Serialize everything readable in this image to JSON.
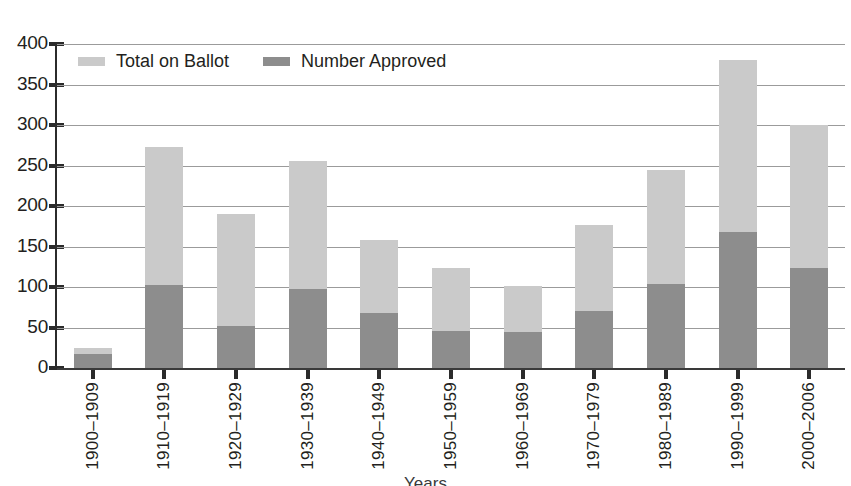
{
  "page": {
    "top_cropped_text": "",
    "x_axis_title_cropped": "Years"
  },
  "legend": {
    "position": "top-left-inside-plot",
    "items": [
      {
        "label": "Total on Ballot",
        "color": "#cacaca",
        "icon": "legend-swatch-icon"
      },
      {
        "label": "Number Approved",
        "color": "#8d8d8d",
        "icon": "legend-swatch-icon"
      }
    ]
  },
  "chart_data": {
    "type": "bar",
    "title": "",
    "subtitle": "",
    "xlabel": "Years",
    "ylabel": "",
    "grid": true,
    "legend_position": "upper-left",
    "ylim": [
      0,
      400
    ],
    "yticks": [
      0,
      50,
      100,
      150,
      200,
      250,
      300,
      350,
      400
    ],
    "ytick_labels": [
      "0",
      "50",
      "100",
      "150",
      "200",
      "250",
      "300",
      "350",
      "400"
    ],
    "bar_style": "overlaid",
    "categories": [
      "1900–1909",
      "1910–1919",
      "1920–1929",
      "1930–1939",
      "1940–1949",
      "1950–1959",
      "1960–1969",
      "1970–1979",
      "1980–1989",
      "1990–1999",
      "2000–2006"
    ],
    "series": [
      {
        "name": "Total on Ballot",
        "color": "#cacaca",
        "values": [
          25,
          273,
          190,
          256,
          158,
          124,
          101,
          176,
          245,
          380,
          300
        ]
      },
      {
        "name": "Number Approved",
        "color": "#8d8d8d",
        "values": [
          17,
          102,
          52,
          97,
          68,
          46,
          44,
          71,
          104,
          168,
          123
        ]
      }
    ]
  }
}
